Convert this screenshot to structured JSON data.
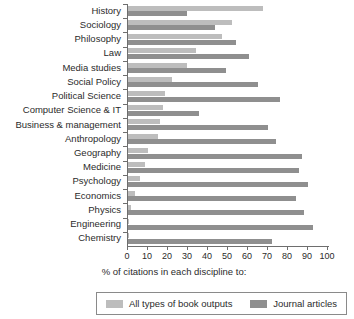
{
  "chart_data": {
    "type": "bar",
    "orientation": "horizontal",
    "title": "",
    "xlabel": "% of citations in each discipline to:",
    "ylabel": "",
    "xlim": [
      0,
      100
    ],
    "xticks": [
      0,
      10,
      20,
      30,
      40,
      50,
      60,
      70,
      80,
      90,
      100
    ],
    "grid": false,
    "legend_position": "bottom",
    "categories": [
      "History",
      "Sociology",
      "Philosophy",
      "Law",
      "Media studies",
      "Social Policy",
      "Political Science",
      "Computer Science & IT",
      "Business & management",
      "Anthropology",
      "Geography",
      "Medicine",
      "Psychology",
      "Economics",
      "Physics",
      "Engineering",
      "Chemistry"
    ],
    "series": [
      {
        "name": "All types of book outputs",
        "color": "#bdbdbd",
        "values": [
          67.5,
          52,
          47,
          34,
          29.5,
          22,
          18.5,
          17.5,
          16,
          15,
          10,
          8.5,
          6,
          3.5,
          1.5,
          0.5,
          0.5
        ]
      },
      {
        "name": "Journal articles",
        "color": "#8f8f8f",
        "values": [
          29.5,
          43.5,
          54,
          60.5,
          49,
          65,
          76,
          35.5,
          70,
          74,
          87,
          85.5,
          90,
          84,
          88,
          92.5,
          72
        ]
      }
    ]
  },
  "legend": {
    "entries": [
      {
        "label": "All types of book outputs",
        "color": "#bdbdbd"
      },
      {
        "label": "Journal articles",
        "color": "#8f8f8f"
      }
    ]
  },
  "axis": {
    "x_title": "% of citations in each discipline to:"
  }
}
